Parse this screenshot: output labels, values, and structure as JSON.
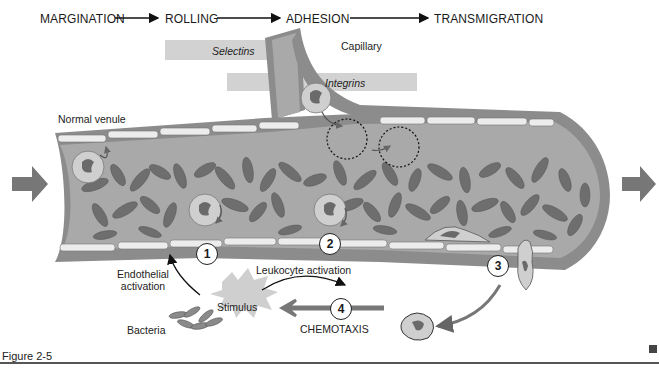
{
  "stages": [
    {
      "label": "MARGINATION"
    },
    {
      "label": "ROLLING"
    },
    {
      "label": "ADHESION"
    },
    {
      "label": "TRANSMIGRATION"
    }
  ],
  "bands": {
    "selectins": "Selectins",
    "integrins": "Integrins"
  },
  "labels": {
    "capillary": "Capillary",
    "normal_venule": "Normal venule",
    "endothelial_activation_1": "Endothelial",
    "endothelial_activation_2": "activation",
    "leukocyte_activation": "Leukocyte activation",
    "stimulus": "Stimulus",
    "bacteria": "Bacteria",
    "chemotaxis": "CHEMOTAXIS"
  },
  "steps": [
    "1",
    "2",
    "3",
    "4"
  ],
  "figure": {
    "caption": "Figure 2-5"
  },
  "colors": {
    "vessel_lumen": "#a9a9a9",
    "vessel_wall": "#8c8c8c",
    "endothelium": "#ececec",
    "rbc": "#6e6e6e",
    "leukocyte": "#cfcfcf",
    "nucleus": "#6a6a6a",
    "flow_arrow": "#777777",
    "band": "#d2d2d2"
  }
}
